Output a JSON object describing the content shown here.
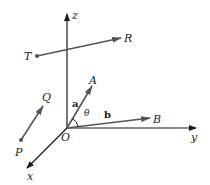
{
  "diagram": {
    "colors": {
      "axis": "#1a1a1a",
      "vector": "#555555",
      "text": "#222222"
    },
    "origin": {
      "label": "O",
      "x": 67,
      "y": 128
    },
    "axes": [
      {
        "name": "z",
        "label": "z",
        "from": [
          67,
          128
        ],
        "to": [
          67,
          13
        ],
        "label_pos": [
          73,
          18
        ]
      },
      {
        "name": "y",
        "label": "y",
        "from": [
          67,
          128
        ],
        "to": [
          197,
          128
        ],
        "label_pos": [
          191,
          140
        ]
      },
      {
        "name": "x",
        "label": "x",
        "from": [
          67,
          128
        ],
        "to": [
          26,
          169
        ],
        "label_pos": [
          27,
          180
        ]
      }
    ],
    "vectors": [
      {
        "name": "TR",
        "from_label": "T",
        "to_label": "R",
        "from": [
          37,
          56
        ],
        "to": [
          122,
          38
        ],
        "from_label_pos": [
          24,
          60
        ],
        "to_label_pos": [
          125,
          42
        ]
      },
      {
        "name": "PQ",
        "from_label": "P",
        "to_label": "Q",
        "from": [
          21,
          140
        ],
        "to": [
          43,
          106
        ],
        "from_label_pos": [
          15,
          155
        ],
        "to_label_pos": [
          42,
          101
        ]
      },
      {
        "name": "OA",
        "from_label": "",
        "to_label": "A",
        "from": [
          67,
          128
        ],
        "to": [
          92,
          86
        ],
        "from_label_pos": [
          0,
          0
        ],
        "to_label_pos": [
          89,
          84
        ]
      },
      {
        "name": "OB",
        "from_label": "",
        "to_label": "B",
        "from": [
          67,
          128
        ],
        "to": [
          150,
          118
        ],
        "from_label_pos": [
          0,
          0
        ],
        "to_label_pos": [
          153,
          122
        ]
      }
    ],
    "vector_labels": {
      "a": "a",
      "b": "b",
      "angle": "θ"
    },
    "labels": {
      "origin": "O",
      "z": "z",
      "y": "y",
      "x": "x",
      "T": "T",
      "R": "R",
      "P": "P",
      "Q": "Q",
      "A": "A",
      "B": "B"
    }
  }
}
